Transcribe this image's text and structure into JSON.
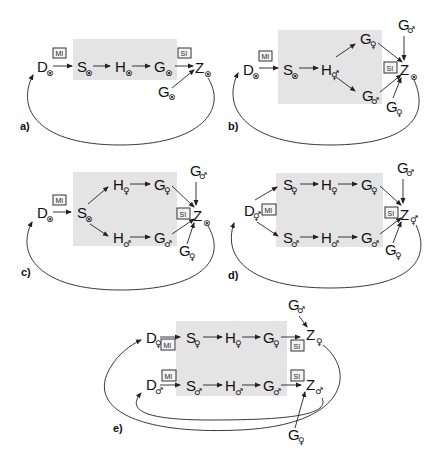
{
  "symbols": {
    "hermaphrodite": "⊗",
    "female": "♀",
    "male": "♂"
  },
  "tags": {
    "meiosis": "MI",
    "syngamy": "SI"
  },
  "panels": {
    "a": {
      "label": "a)",
      "nodes": {
        "D": {
          "letter": "D",
          "sub": "⊗"
        },
        "S": {
          "letter": "S",
          "sub": "⊗"
        },
        "H": {
          "letter": "H",
          "sub": "⊗"
        },
        "G": {
          "letter": "G",
          "sub": "⊗"
        },
        "Z": {
          "letter": "Z",
          "sub": "⊗"
        },
        "Gext": {
          "letter": "G",
          "sub": "⊗"
        }
      }
    },
    "b": {
      "label": "b)",
      "nodes": {
        "D": {
          "letter": "D",
          "sub": "⊗"
        },
        "S": {
          "letter": "S",
          "sub": "⊗"
        },
        "H": {
          "letter": "H",
          "sub": "⚥"
        },
        "Gf": {
          "letter": "G",
          "sub": "♀"
        },
        "Gm": {
          "letter": "G",
          "sub": "♂"
        },
        "Z": {
          "letter": "Z",
          "sub": "⊗"
        },
        "GextM": {
          "letter": "G",
          "sub": "♂"
        },
        "GextF": {
          "letter": "G",
          "sub": "♀"
        }
      }
    },
    "c": {
      "label": "c)",
      "nodes": {
        "D": {
          "letter": "D",
          "sub": "⊗"
        },
        "S": {
          "letter": "S",
          "sub": "⊗"
        },
        "Hf": {
          "letter": "H",
          "sub": "♀"
        },
        "Hm": {
          "letter": "H",
          "sub": "♂"
        },
        "Gf": {
          "letter": "G",
          "sub": "♀"
        },
        "Gm": {
          "letter": "G",
          "sub": "♂"
        },
        "Z": {
          "letter": "Z",
          "sub": "⊗"
        },
        "GextM": {
          "letter": "G",
          "sub": "♂"
        },
        "GextF": {
          "letter": "G",
          "sub": "♀"
        }
      }
    },
    "d": {
      "label": "d)",
      "nodes": {
        "D": {
          "letter": "D",
          "sub": "⚥"
        },
        "Sf": {
          "letter": "S",
          "sub": "♀"
        },
        "Hf": {
          "letter": "H",
          "sub": "♀"
        },
        "Gf": {
          "letter": "G",
          "sub": "♀"
        },
        "Sm": {
          "letter": "S",
          "sub": "♂"
        },
        "Hm": {
          "letter": "H",
          "sub": "♂"
        },
        "Gm": {
          "letter": "G",
          "sub": "♂"
        },
        "Z": {
          "letter": "Z",
          "sub": "⚥"
        },
        "GextM": {
          "letter": "G",
          "sub": "♂"
        },
        "GextF": {
          "letter": "G",
          "sub": "♀"
        }
      }
    },
    "e": {
      "label": "e)",
      "nodes": {
        "Df": {
          "letter": "D",
          "sub": "♀"
        },
        "Sf": {
          "letter": "S",
          "sub": "♀"
        },
        "Hf": {
          "letter": "H",
          "sub": "♀"
        },
        "Gf": {
          "letter": "G",
          "sub": "♀"
        },
        "Zf": {
          "letter": "Z",
          "sub": "♀"
        },
        "Dm": {
          "letter": "D",
          "sub": "♂"
        },
        "Sm": {
          "letter": "S",
          "sub": "♂"
        },
        "Hm": {
          "letter": "H",
          "sub": "♂"
        },
        "Gm": {
          "letter": "G",
          "sub": "♂"
        },
        "Zm": {
          "letter": "Z",
          "sub": "♂"
        },
        "GextM": {
          "letter": "G",
          "sub": "♂"
        },
        "GextF": {
          "letter": "G",
          "sub": "♀"
        }
      }
    }
  },
  "colors": {
    "shade": "#e4e4e4",
    "ink": "#111111"
  }
}
